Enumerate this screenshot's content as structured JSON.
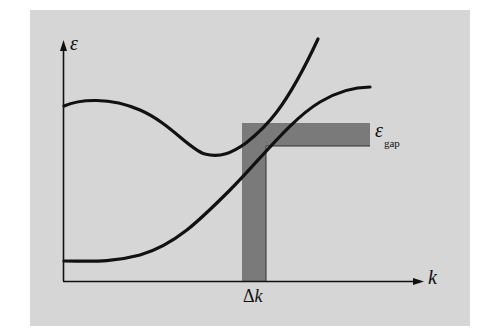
{
  "diagram": {
    "title": "",
    "panel_background": "#d6d6d6",
    "band_color": "#7a7a7a",
    "line_color": "#111111",
    "axes": {
      "y_label": "ε",
      "x_label": "k"
    },
    "labels": {
      "energy_gap_symbol": "ε",
      "energy_gap_subscript": "gap",
      "delta_k_symbol": "Δ",
      "delta_k_var": "k"
    },
    "curves": [
      {
        "name": "upper-band",
        "description": "Starts high at k=0, dips to a minimum, then rises steeply"
      },
      {
        "name": "lower-band",
        "description": "Flat at low energy, rises monotonically and levels off"
      }
    ],
    "bands": [
      {
        "name": "energy-gap-band",
        "orientation": "horizontal",
        "label": "ε_gap"
      },
      {
        "name": "delta-k-band",
        "orientation": "vertical",
        "label": "Δk"
      }
    ]
  }
}
